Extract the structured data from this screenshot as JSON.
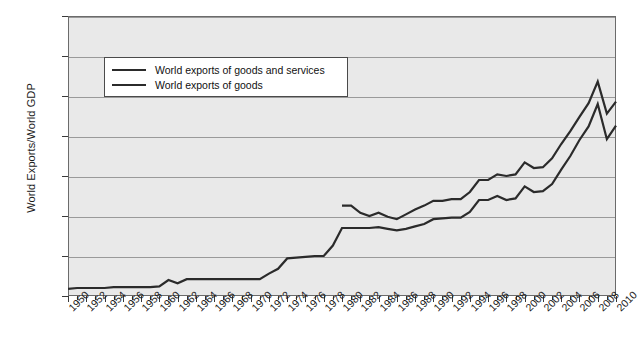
{
  "chart_data": {
    "type": "line",
    "title": "",
    "xlabel": "",
    "ylabel": "World Exports/World GDP",
    "xlim": [
      1950,
      2010
    ],
    "ylim": [
      0.0,
      0.35
    ],
    "grid": true,
    "legend_position": "upper-left-inside",
    "ytick_labels": [
      "0.000",
      "0.050",
      "0.100",
      "0.150",
      "0.200",
      "0.250",
      "0.300",
      "0.350"
    ],
    "ytick_values": [
      0.0,
      0.05,
      0.1,
      0.15,
      0.2,
      0.25,
      0.3,
      0.35
    ],
    "xtick_labels": [
      "1950",
      "1952",
      "1954",
      "1956",
      "1958",
      "1960",
      "1962",
      "1964",
      "1966",
      "1968",
      "1970",
      "1972",
      "1974",
      "1976",
      "1978",
      "1980",
      "1982",
      "1984",
      "1986",
      "1988",
      "1990",
      "1992",
      "1994",
      "1996",
      "1998",
      "2000",
      "2002",
      "2004",
      "2006",
      "2008",
      "2010"
    ],
    "xtick_values": [
      1950,
      1952,
      1954,
      1956,
      1958,
      1960,
      1962,
      1964,
      1966,
      1968,
      1970,
      1972,
      1974,
      1976,
      1978,
      1980,
      1982,
      1984,
      1986,
      1988,
      1990,
      1992,
      1994,
      1996,
      1998,
      2000,
      2002,
      2004,
      2006,
      2008,
      2010
    ],
    "series": [
      {
        "name": "World exports of goods and services",
        "x": [
          1980,
          1981,
          1982,
          1983,
          1984,
          1985,
          1986,
          1987,
          1988,
          1989,
          1990,
          1991,
          1992,
          1993,
          1994,
          1995,
          1996,
          1997,
          1998,
          1999,
          2000,
          2001,
          2002,
          2003,
          2004,
          2005,
          2006,
          2007,
          2008,
          2009,
          2010
        ],
        "values": [
          0.113,
          0.113,
          0.104,
          0.1,
          0.104,
          0.099,
          0.096,
          0.102,
          0.108,
          0.113,
          0.119,
          0.119,
          0.121,
          0.121,
          0.13,
          0.145,
          0.145,
          0.152,
          0.15,
          0.152,
          0.167,
          0.16,
          0.161,
          0.172,
          0.19,
          0.206,
          0.224,
          0.241,
          0.268,
          0.228,
          0.243
        ]
      },
      {
        "name": "World exports of goods",
        "x": [
          1950,
          1951,
          1952,
          1953,
          1954,
          1955,
          1956,
          1957,
          1958,
          1959,
          1960,
          1961,
          1962,
          1963,
          1964,
          1965,
          1966,
          1967,
          1968,
          1969,
          1970,
          1971,
          1972,
          1973,
          1974,
          1975,
          1976,
          1977,
          1978,
          1979,
          1980,
          1981,
          1982,
          1983,
          1984,
          1985,
          1986,
          1987,
          1988,
          1989,
          1990,
          1991,
          1992,
          1993,
          1994,
          1995,
          1996,
          1997,
          1998,
          1999,
          2000,
          2001,
          2002,
          2003,
          2004,
          2005,
          2006,
          2007,
          2008,
          2009,
          2010
        ],
        "values": [
          0.009,
          0.01,
          0.01,
          0.01,
          0.01,
          0.011,
          0.011,
          0.011,
          0.011,
          0.011,
          0.012,
          0.02,
          0.016,
          0.021,
          0.021,
          0.021,
          0.021,
          0.021,
          0.021,
          0.021,
          0.021,
          0.021,
          0.028,
          0.034,
          0.047,
          0.048,
          0.049,
          0.05,
          0.05,
          0.063,
          0.085,
          0.085,
          0.085,
          0.085,
          0.086,
          0.084,
          0.082,
          0.084,
          0.087,
          0.09,
          0.096,
          0.097,
          0.098,
          0.098,
          0.105,
          0.12,
          0.12,
          0.125,
          0.12,
          0.122,
          0.137,
          0.13,
          0.131,
          0.14,
          0.158,
          0.175,
          0.195,
          0.212,
          0.24,
          0.196,
          0.213
        ]
      }
    ]
  },
  "legend": {
    "items": [
      {
        "label": "World exports of goods and services",
        "color": "#2b2b2b"
      },
      {
        "label": "World exports of goods",
        "color": "#2b2b2b"
      }
    ]
  },
  "colors": {
    "plot_background": "#e9e9e9",
    "gridline": "#9a9a9a",
    "line": "#2b2b2b",
    "frame": "#6b6b6b",
    "text": "#1a1a1a"
  }
}
